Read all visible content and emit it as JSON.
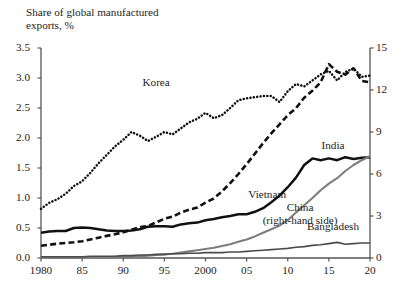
{
  "chart_data": {
    "type": "line",
    "title": "Share of global manufactured\nexports, %",
    "xlabel": "",
    "ylabel": "Share of global manufactured exports, %",
    "ylabel_right": "Share of global manufactured exports, % (China)",
    "grid": false,
    "legend": "inline-labels",
    "x": [
      1980,
      1981,
      1982,
      1983,
      1984,
      1985,
      1986,
      1987,
      1988,
      1989,
      1990,
      1991,
      1992,
      1993,
      1994,
      1995,
      1996,
      1997,
      1998,
      1999,
      2000,
      2001,
      2002,
      2003,
      2004,
      2005,
      2006,
      2007,
      2008,
      2009,
      2010,
      2011,
      2012,
      2013,
      2014,
      2015,
      2016,
      2017,
      2018,
      2019,
      2020
    ],
    "xlim": [
      1980,
      2020
    ],
    "xticks": [
      1980,
      1985,
      1990,
      1995,
      2000,
      2005,
      2010,
      2015,
      2020
    ],
    "xtick_labels": [
      "1980",
      "85",
      "90",
      "95",
      "2000",
      "05",
      "10",
      "15",
      "20"
    ],
    "ylim": [
      0.0,
      3.5
    ],
    "yticks": [
      0.0,
      0.5,
      1.0,
      1.5,
      2.0,
      2.5,
      3.0,
      3.5
    ],
    "ytick_labels": [
      "0.0",
      "0.5",
      "1.0",
      "1.5",
      "2.0",
      "2.5",
      "3.0",
      "3.5"
    ],
    "ylim_right": [
      0,
      15
    ],
    "yticks_right": [
      0,
      3,
      6,
      9,
      12,
      15
    ],
    "ytick_labels_right": [
      "0",
      "3",
      "6",
      "9",
      "12",
      "15"
    ],
    "series": [
      {
        "name": "Korea",
        "axis": "left",
        "style": "dotted",
        "color": "#111111",
        "label_x": 1994,
        "label_y": 2.92,
        "values": [
          0.82,
          0.92,
          0.98,
          1.07,
          1.2,
          1.28,
          1.42,
          1.58,
          1.72,
          1.86,
          1.97,
          2.1,
          2.04,
          1.95,
          2.02,
          2.1,
          2.06,
          2.16,
          2.26,
          2.32,
          2.42,
          2.33,
          2.38,
          2.5,
          2.63,
          2.66,
          2.68,
          2.7,
          2.7,
          2.6,
          2.78,
          2.9,
          2.86,
          2.96,
          3.06,
          3.12,
          2.96,
          3.1,
          3.16,
          3.02,
          3.04
        ]
      },
      {
        "name": "China",
        "axis": "right",
        "style": "dashed",
        "color": "#111111",
        "label_x": 2011.5,
        "label_y": 3.55,
        "label_text": "China\n(right-hand side)",
        "values": [
          0.88,
          0.95,
          1.02,
          1.08,
          1.12,
          1.2,
          1.32,
          1.45,
          1.58,
          1.7,
          1.84,
          2.02,
          2.2,
          2.28,
          2.55,
          2.8,
          2.95,
          3.25,
          3.45,
          3.6,
          3.95,
          4.25,
          4.75,
          5.35,
          6.0,
          6.7,
          7.45,
          8.2,
          8.9,
          9.55,
          10.2,
          10.7,
          11.45,
          11.95,
          12.55,
          13.85,
          13.3,
          13.1,
          13.55,
          12.65,
          12.55
        ]
      },
      {
        "name": "India",
        "axis": "left",
        "style": "solid-thick",
        "color": "#111111",
        "label_x": 2015.5,
        "label_y": 1.86,
        "values": [
          0.42,
          0.44,
          0.45,
          0.45,
          0.5,
          0.51,
          0.5,
          0.48,
          0.46,
          0.45,
          0.45,
          0.46,
          0.48,
          0.52,
          0.53,
          0.53,
          0.52,
          0.56,
          0.58,
          0.59,
          0.63,
          0.65,
          0.68,
          0.7,
          0.73,
          0.73,
          0.77,
          0.83,
          0.93,
          1.04,
          1.18,
          1.34,
          1.55,
          1.66,
          1.63,
          1.66,
          1.63,
          1.68,
          1.65,
          1.67,
          1.68
        ]
      },
      {
        "name": "Vietnam",
        "axis": "left",
        "style": "solid-gray",
        "color": "#7d7d7d",
        "label_x": 2007.5,
        "label_y": 1.05,
        "values": [
          0.01,
          0.01,
          0.01,
          0.01,
          0.01,
          0.01,
          0.01,
          0.01,
          0.01,
          0.02,
          0.02,
          0.02,
          0.03,
          0.04,
          0.05,
          0.06,
          0.07,
          0.09,
          0.11,
          0.13,
          0.15,
          0.17,
          0.2,
          0.23,
          0.27,
          0.31,
          0.36,
          0.42,
          0.48,
          0.54,
          0.63,
          0.76,
          0.88,
          1.0,
          1.13,
          1.24,
          1.33,
          1.45,
          1.55,
          1.63,
          1.7
        ]
      },
      {
        "name": "Bangladesh",
        "axis": "left",
        "style": "solid-darkgray",
        "color": "#4c4c4c",
        "label_x": 2015.5,
        "label_y": 0.52,
        "values": [
          0.02,
          0.02,
          0.02,
          0.02,
          0.02,
          0.02,
          0.03,
          0.03,
          0.03,
          0.03,
          0.04,
          0.04,
          0.05,
          0.05,
          0.06,
          0.06,
          0.07,
          0.07,
          0.08,
          0.08,
          0.09,
          0.09,
          0.09,
          0.1,
          0.1,
          0.11,
          0.12,
          0.13,
          0.14,
          0.15,
          0.16,
          0.18,
          0.19,
          0.21,
          0.22,
          0.24,
          0.26,
          0.23,
          0.24,
          0.25,
          0.25
        ]
      }
    ]
  },
  "axes": {
    "left_ticks": [
      "3.5",
      "3.0",
      "2.5",
      "2.0",
      "1.5",
      "1.0",
      "0.5",
      "0.0"
    ],
    "right_ticks": [
      "15",
      "12",
      "9",
      "6",
      "3",
      "0"
    ],
    "x_ticks": [
      "1980",
      "85",
      "90",
      "95",
      "2000",
      "05",
      "10",
      "15",
      "20"
    ]
  },
  "labels": {
    "title": "Share of global manufactured\nexports, %",
    "korea": "Korea",
    "china": "China\n(right-hand side)",
    "india": "India",
    "vietnam": "Vietnam",
    "bangladesh": "Bangladesh"
  },
  "footer": {
    "cropped_caption": ""
  }
}
